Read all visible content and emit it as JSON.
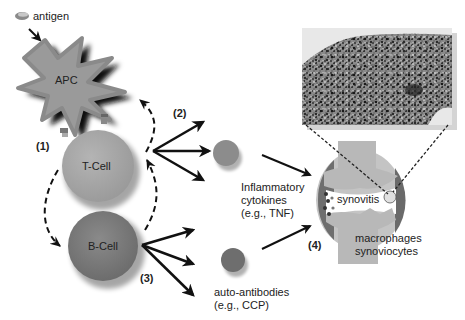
{
  "diagram": {
    "labels": {
      "antigen": "antigen",
      "apc": "APC",
      "tcell": "T-Cell",
      "bcell": "B-Cell",
      "step1": "(1)",
      "step2": "(2)",
      "step3": "(3)",
      "step4": "(4)",
      "cytokines_line1": "Inflammatory",
      "cytokines_line2": "cytokines",
      "cytokines_line3": "(e.g., TNF)",
      "autoab_line1": "auto-antibodies",
      "autoab_line2": "(e.g., CCP)",
      "synovitis": "synovitis",
      "cells_line1": "macrophages",
      "cells_line2": "synoviocytes"
    },
    "colors": {
      "apc": "#9a9a9a",
      "apc_shadow": "#111111",
      "tcell": "#a8a8a8",
      "bcell": "#7a7a7a",
      "cytokine": "#8c8c8c",
      "antibody": "#6e6e6e",
      "joint": "#b8b8b8",
      "synovium": "#6a6a6a",
      "arrow": "#111111"
    },
    "icons": [
      "antigen-icon",
      "micrograph-image",
      "joint-illustration"
    ]
  }
}
